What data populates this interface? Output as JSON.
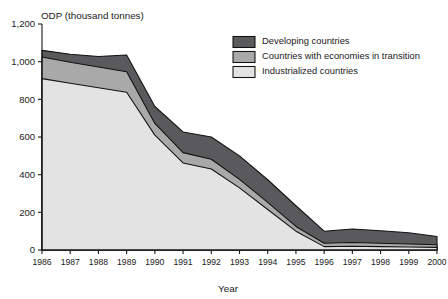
{
  "chart_data": {
    "type": "area",
    "stacked": true,
    "title": "ODP (thousand tonnes)",
    "xlabel": "Year",
    "ylabel": "",
    "categories": [
      "1986",
      "1987",
      "1988",
      "1989",
      "1990",
      "1991",
      "1992",
      "1993",
      "1994",
      "1995",
      "1996",
      "1997",
      "1998",
      "1999",
      "2000"
    ],
    "x": [
      1986,
      1987,
      1988,
      1989,
      1990,
      1991,
      1992,
      1993,
      1994,
      1995,
      1996,
      1997,
      1998,
      1999,
      2000
    ],
    "ylim": [
      0,
      1200
    ],
    "yticks": [
      0,
      200,
      400,
      600,
      800,
      1000,
      1200
    ],
    "ytick_labels": [
      "0",
      "200",
      "400",
      "600",
      "800",
      "1,000",
      "1,200"
    ],
    "grid": false,
    "legend_position": "top-right-inside",
    "series": [
      {
        "name": "Industrialized countries",
        "color": "#e3e3e3",
        "stack_order": 1,
        "values": [
          910,
          885,
          862,
          838,
          610,
          462,
          430,
          330,
          215,
          100,
          18,
          20,
          18,
          16,
          14
        ]
      },
      {
        "name": "Countries with economies in transition",
        "color": "#a9a9a9",
        "stack_order": 2,
        "values": [
          115,
          112,
          110,
          108,
          62,
          55,
          52,
          45,
          38,
          25,
          18,
          20,
          18,
          16,
          14
        ]
      },
      {
        "name": "Developing countries",
        "color": "#5a5a5c",
        "stack_order": 3,
        "values": [
          35,
          42,
          55,
          89,
          90,
          110,
          118,
          125,
          120,
          110,
          64,
          72,
          66,
          60,
          44
        ]
      }
    ],
    "totals": [
      1060,
      1039,
      1027,
      1035,
      762,
      627,
      600,
      500,
      373,
      235,
      100,
      112,
      102,
      92,
      72
    ]
  },
  "legend": {
    "items": [
      {
        "label": "Developing countries",
        "color": "#5a5a5c"
      },
      {
        "label": "Countries with economies in transition",
        "color": "#a9a9a9"
      },
      {
        "label": "Industrialized countries",
        "color": "#e3e3e3"
      }
    ]
  }
}
